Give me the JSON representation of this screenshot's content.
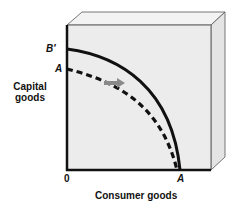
{
  "diagram": {
    "type": "production-possibilities-frontier-shift",
    "y_axis_label": "Capital goods",
    "x_axis_label": "Consumer goods",
    "origin_label": "0",
    "y_intercept_labels": {
      "new_curve": "B′",
      "old_curve": "A"
    },
    "x_intercept_label": "A",
    "curves": [
      {
        "name": "original-ppf",
        "style": "dashed",
        "y_intercept": "A",
        "x_intercept": "A"
      },
      {
        "name": "shifted-ppf",
        "style": "solid",
        "y_intercept": "B′",
        "x_intercept": "A"
      }
    ],
    "arrow": {
      "direction": "right",
      "meaning": "outward shift of capital goods frontier",
      "color": "#8a8a8a"
    },
    "colors": {
      "box_face": "#ececec",
      "box_top": "#f3f3f3",
      "box_side": "#e2e2e2",
      "axis": "#111111",
      "curve": "#111111"
    }
  }
}
